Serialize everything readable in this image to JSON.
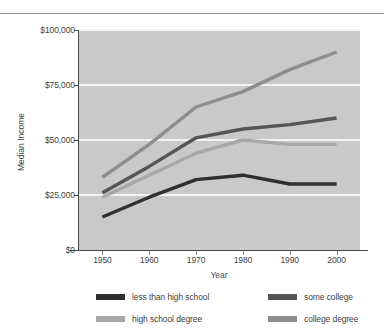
{
  "chart_data": {
    "type": "line",
    "title": "",
    "xlabel": "Year",
    "ylabel": "Median Income",
    "x": [
      1950,
      1960,
      1970,
      1980,
      1990,
      2000
    ],
    "xtick_labels": [
      "1950",
      "1960",
      "1970",
      "1980",
      "1990",
      "2000"
    ],
    "ytick_labels": [
      "$0",
      "$25,000",
      "$50,000",
      "$75,000",
      "$100,000"
    ],
    "ytick_values": [
      0,
      25000,
      50000,
      75000,
      100000
    ],
    "xlim": [
      1945,
      2005
    ],
    "ylim": [
      0,
      100000
    ],
    "grid": "horizontal",
    "legend_position": "bottom",
    "plot_background": "#c9c9c9",
    "gridline_color": "#f3f3f3",
    "series": [
      {
        "name": "less than high school",
        "color": "#2f2f2f",
        "values": [
          15000,
          24000,
          32000,
          34000,
          30000,
          30000
        ]
      },
      {
        "name": "high school degree",
        "color": "#a8a8a8",
        "values": [
          24000,
          34000,
          44000,
          50000,
          48000,
          48000
        ]
      },
      {
        "name": "some college",
        "color": "#555555",
        "values": [
          26000,
          38000,
          51000,
          55000,
          57000,
          60000
        ]
      },
      {
        "name": "college degree",
        "color": "#8d8d8d",
        "values": [
          33000,
          48000,
          65000,
          72000,
          82000,
          90000
        ]
      }
    ]
  },
  "legend": {
    "items": [
      {
        "label": "less than high school",
        "color": "#2f2f2f"
      },
      {
        "label": "high school degree",
        "color": "#a8a8a8"
      },
      {
        "label": "some college",
        "color": "#555555"
      },
      {
        "label": "college degree",
        "color": "#8d8d8d"
      }
    ]
  }
}
